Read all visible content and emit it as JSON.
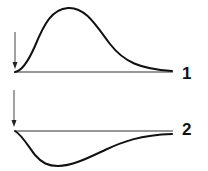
{
  "figure": {
    "traces": [
      {
        "label": "1",
        "direction": "positive",
        "shape": "skewed-peak"
      },
      {
        "label": "2",
        "direction": "negative",
        "shape": "skewed-trough"
      }
    ],
    "markers": [
      {
        "icon": "down-arrow-icon",
        "meaning": "stimulus onset"
      },
      {
        "icon": "down-arrow-icon",
        "meaning": "stimulus onset"
      }
    ],
    "colors": {
      "ink": "#111111",
      "background": "#ffffff"
    }
  }
}
